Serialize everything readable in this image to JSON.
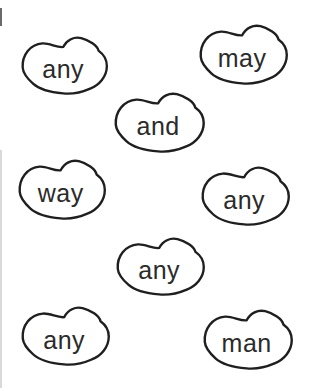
{
  "page": {
    "background_color": "#ffffff",
    "ink_color": "#1f1f1f",
    "text_color": "#2b2b2b",
    "shape_name": "bean-outline"
  },
  "beans": [
    {
      "word": "any"
    },
    {
      "word": "may"
    },
    {
      "word": "and"
    },
    {
      "word": "way"
    },
    {
      "word": "any"
    },
    {
      "word": "any"
    },
    {
      "word": "any"
    },
    {
      "word": "man"
    }
  ]
}
